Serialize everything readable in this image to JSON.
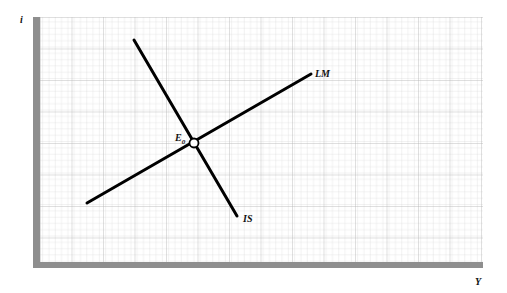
{
  "diagram": {
    "type": "IS-LM",
    "axes": {
      "y_label": "i",
      "x_label": "Y"
    },
    "curves": [
      {
        "name": "IS",
        "label": "IS",
        "from": [
          134,
          40
        ],
        "to": [
          237,
          216
        ]
      },
      {
        "name": "LM",
        "label": "LM",
        "from": [
          87,
          203
        ],
        "to": [
          311,
          74
        ]
      }
    ],
    "equilibrium": {
      "label": "E",
      "subscript": "0",
      "point": [
        194,
        143
      ]
    },
    "colors": {
      "grid": "#c8c8c8",
      "axis": "#8a8a8a",
      "curve": "#000000"
    }
  }
}
